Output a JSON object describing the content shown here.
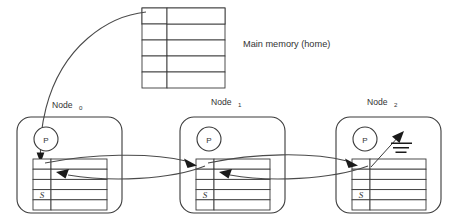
{
  "figure": {
    "title_visible": false,
    "background_color": "#ffffff",
    "line_color": "#3a3a3a",
    "arrow_color": "#1a1a1a"
  },
  "main_memory": {
    "label": "Main memory (home)",
    "rows": 5,
    "columns": 2,
    "cells": [
      {
        "tag": "",
        "data": ""
      },
      {
        "tag": "",
        "data": ""
      },
      {
        "tag": "",
        "data": ""
      },
      {
        "tag": "",
        "data": ""
      },
      {
        "tag": "",
        "data": ""
      }
    ]
  },
  "nodes": [
    {
      "label": "Node",
      "subscript": "0",
      "processor_label": "P",
      "cache": {
        "rows": 5,
        "columns": 2,
        "state_row_index": 3,
        "state_label": "S"
      },
      "has_writeback_glyph": false
    },
    {
      "label": "Node",
      "subscript": "1",
      "processor_label": "P",
      "cache": {
        "rows": 5,
        "columns": 2,
        "state_row_index": 3,
        "state_label": "S"
      },
      "has_writeback_glyph": false
    },
    {
      "label": "Node",
      "subscript": "2",
      "processor_label": "P",
      "cache": {
        "rows": 5,
        "columns": 2,
        "state_row_index": 3,
        "state_label": "S"
      },
      "has_writeback_glyph": true
    }
  ],
  "connections": [
    {
      "name": "home-to-node0",
      "from": "main-memory-row-0",
      "to": "node0-cache-row-0",
      "arrowheads": 1
    },
    {
      "name": "node0-node1-upper",
      "from": "node0-cache-row-0",
      "to": "node1-cache-row-0",
      "arrowheads": 1
    },
    {
      "name": "node1-node0-lower",
      "from": "node1-cache-row-0",
      "to": "node0-cache-row-1",
      "arrowheads": 1
    },
    {
      "name": "node1-node2-upper",
      "from": "node1-cache-row-0",
      "to": "node2-cache-row-0",
      "arrowheads": 1
    },
    {
      "name": "node2-node1-lower",
      "from": "node2-cache-row-0",
      "to": "node1-cache-row-1",
      "arrowheads": 1
    }
  ]
}
